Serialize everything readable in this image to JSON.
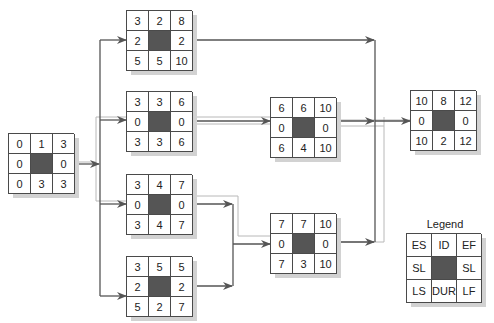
{
  "diagram": {
    "type": "activity-on-node-network",
    "colors": {
      "arrow": "#555555",
      "critical_path": "#b8b8b8",
      "node_border": "#4a4a4a",
      "node_center": "#555555",
      "shadow": "#d2d2d2"
    },
    "nodes": [
      {
        "key": "start",
        "es": "0",
        "id": "1",
        "ef": "3",
        "sl_left": "0",
        "sl_right": "0",
        "ls": "0",
        "dur": "3",
        "lf": "3",
        "critical": true
      },
      {
        "key": "a",
        "es": "3",
        "id": "2",
        "ef": "8",
        "sl_left": "2",
        "sl_right": "2",
        "ls": "5",
        "dur": "5",
        "lf": "10",
        "critical": false
      },
      {
        "key": "b",
        "es": "3",
        "id": "3",
        "ef": "6",
        "sl_left": "0",
        "sl_right": "0",
        "ls": "3",
        "dur": "3",
        "lf": "6",
        "critical": true
      },
      {
        "key": "c",
        "es": "3",
        "id": "4",
        "ef": "7",
        "sl_left": "0",
        "sl_right": "0",
        "ls": "3",
        "dur": "4",
        "lf": "7",
        "critical": true
      },
      {
        "key": "d",
        "es": "3",
        "id": "5",
        "ef": "5",
        "sl_left": "2",
        "sl_right": "2",
        "ls": "5",
        "dur": "2",
        "lf": "7",
        "critical": false
      },
      {
        "key": "e",
        "es": "6",
        "id": "6",
        "ef": "10",
        "sl_left": "0",
        "sl_right": "0",
        "ls": "6",
        "dur": "4",
        "lf": "10",
        "critical": true
      },
      {
        "key": "f",
        "es": "7",
        "id": "7",
        "ef": "10",
        "sl_left": "0",
        "sl_right": "0",
        "ls": "7",
        "dur": "3",
        "lf": "10",
        "critical": true
      },
      {
        "key": "end",
        "es": "10",
        "id": "8",
        "ef": "12",
        "sl_left": "0",
        "sl_right": "0",
        "ls": "10",
        "dur": "2",
        "lf": "12",
        "critical": true
      }
    ],
    "edges": [
      {
        "from": "1",
        "to": "2"
      },
      {
        "from": "1",
        "to": "3"
      },
      {
        "from": "1",
        "to": "4"
      },
      {
        "from": "1",
        "to": "5"
      },
      {
        "from": "2",
        "to": "8"
      },
      {
        "from": "3",
        "to": "6"
      },
      {
        "from": "4",
        "to": "7"
      },
      {
        "from": "5",
        "to": "7"
      },
      {
        "from": "6",
        "to": "8"
      },
      {
        "from": "7",
        "to": "8"
      }
    ],
    "critical_path": [
      "1",
      "3",
      "6",
      "8",
      "4",
      "7"
    ],
    "legend": {
      "title": "Legend",
      "cells": {
        "es": "ES",
        "id": "ID",
        "ef": "EF",
        "sl_left": "SL",
        "sl_right": "SL",
        "ls": "LS",
        "dur": "DUR",
        "lf": "LF"
      }
    }
  }
}
